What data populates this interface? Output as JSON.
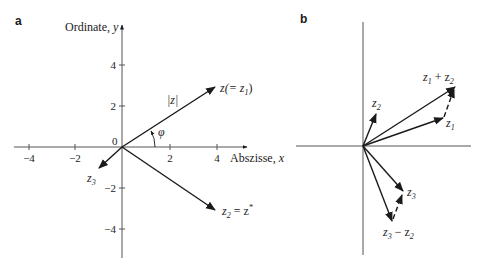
{
  "panel_a": {
    "label": "a",
    "y_axis_title": "Ordinate, ",
    "y_axis_var": "y",
    "x_axis_title": "Abszisse, ",
    "x_axis_var": "x",
    "origin_label": "0",
    "x_ticks": [
      "−4",
      "−2",
      "2",
      "4"
    ],
    "y_ticks": [
      "4",
      "2",
      "−2",
      "−4"
    ],
    "vectors": {
      "z": {
        "main": "z(= z",
        "sub": "1",
        "close": ")"
      },
      "z2": {
        "main": "z",
        "sub": "2",
        "rest": " = z",
        "sup": "*"
      },
      "z3": {
        "main": "z",
        "sub": "3"
      }
    },
    "modulus_label": "|z|",
    "angle_label": "φ"
  },
  "panel_b": {
    "label": "b",
    "vectors": {
      "z1": {
        "main": "z",
        "sub": "1"
      },
      "z2": {
        "main": "z",
        "sub": "2"
      },
      "z1_plus_z2": {
        "a": "z",
        "a_sub": "1",
        "op": " + z",
        "b_sub": "2"
      },
      "z3": {
        "main": "z",
        "sub": "3"
      },
      "z3_minus_z2": {
        "a": "z",
        "a_sub": "3",
        "op": " − z",
        "b_sub": "2"
      }
    }
  },
  "colors": {
    "ink": "#1a1a1a",
    "axis": "#555555",
    "background": "#ffffff"
  }
}
